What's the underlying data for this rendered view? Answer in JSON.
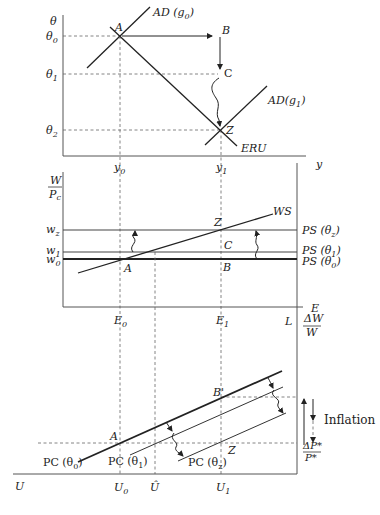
{
  "diagram": {
    "type": "three-panel macroeconomic diagram (AD-ERU, WS-PS, Phillips curves)",
    "panel_top": {
      "y_axis_label": "θ",
      "x_axis_label": "y",
      "y_ticks": [
        {
          "base": "θ",
          "sub": "0"
        },
        {
          "base": "θ",
          "sub": "1"
        },
        {
          "base": "θ",
          "sub": "2"
        }
      ],
      "x_ticks": [
        {
          "base": "y",
          "sub": "0"
        },
        {
          "base": "y",
          "sub": "1"
        }
      ],
      "curves": {
        "ad_g0": {
          "pre": "AD (g",
          "sub": "0",
          "post": ")"
        },
        "ad_g1": {
          "pre": "AD(g",
          "sub": "1",
          "post": ")"
        },
        "eru": "ERU"
      },
      "points": {
        "A": "A",
        "B": "B",
        "C": "C",
        "Z": "Z"
      }
    },
    "panel_middle": {
      "y_axis_label": {
        "num": "W",
        "den_base": "P",
        "den_sub": "c"
      },
      "x_axis_label": "E",
      "right_label": "L",
      "y_ticks": [
        {
          "base": "w",
          "sub": "z"
        },
        {
          "base": "w",
          "sub": "1"
        },
        {
          "base": "w",
          "sub": "0"
        }
      ],
      "x_ticks": [
        {
          "base": "E",
          "sub": "0"
        },
        {
          "base": "E",
          "sub": "1"
        }
      ],
      "curves": {
        "ws": "WS",
        "ps_z": {
          "pre": "PS (θ",
          "sub": "z",
          "post": ")"
        },
        "ps_1": {
          "pre": "PS (θ",
          "sub": "1",
          "post": ")"
        },
        "ps_0": {
          "pre": "PS (θ",
          "sub": "0",
          "post": ")"
        }
      },
      "points": {
        "A": "A",
        "B": "B",
        "C": "C",
        "Z": "Z"
      }
    },
    "panel_bottom": {
      "x_axis_label": "U",
      "right_axis_label": {
        "num": "ΔW",
        "den": "W"
      },
      "right_axis_bottom_label": {
        "num": "ΔP*",
        "den": "P*"
      },
      "x_ticks": [
        {
          "base": "U",
          "sub": "0"
        },
        {
          "base": "Û",
          "sub": ""
        },
        {
          "base": "U",
          "sub": "1"
        }
      ],
      "curves": {
        "pc_0": {
          "pre": "PC (θ",
          "sub": "0",
          "post": ")"
        },
        "pc_1": {
          "pre": "PC (θ",
          "sub": "1",
          "post": ")"
        },
        "pc_z": {
          "pre": "PC (θ",
          "sub": "z",
          "post": ")"
        }
      },
      "points": {
        "A": "A",
        "B": "B'",
        "Z": "Z"
      },
      "annotation": "Inflation"
    }
  }
}
